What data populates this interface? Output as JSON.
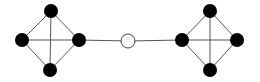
{
  "diagram": {
    "type": "graph",
    "width": 260,
    "height": 82,
    "colors": {
      "background": "#ffffff",
      "edge": "#555555",
      "filled_node": "#000000",
      "hollow_node_fill": "#ffffff",
      "hollow_node_stroke": "#444444"
    },
    "node_radius": 7,
    "nodes": [
      {
        "id": "L_top",
        "x": 51,
        "y": 11,
        "style": "filled"
      },
      {
        "id": "L_left",
        "x": 22,
        "y": 40,
        "style": "filled"
      },
      {
        "id": "L_right",
        "x": 79,
        "y": 40,
        "style": "filled"
      },
      {
        "id": "L_bottom",
        "x": 50,
        "y": 70,
        "style": "filled"
      },
      {
        "id": "center",
        "x": 128,
        "y": 41,
        "style": "hollow"
      },
      {
        "id": "R_left",
        "x": 182,
        "y": 40,
        "style": "filled"
      },
      {
        "id": "R_top",
        "x": 210,
        "y": 11,
        "style": "filled"
      },
      {
        "id": "R_right",
        "x": 237,
        "y": 40,
        "style": "filled"
      },
      {
        "id": "R_bottom",
        "x": 210,
        "y": 70,
        "style": "filled"
      }
    ],
    "edges": [
      [
        "L_top",
        "L_left"
      ],
      [
        "L_top",
        "L_right"
      ],
      [
        "L_left",
        "L_bottom"
      ],
      [
        "L_right",
        "L_bottom"
      ],
      [
        "L_left",
        "L_right"
      ],
      [
        "L_top",
        "L_bottom"
      ],
      [
        "L_right",
        "center"
      ],
      [
        "center",
        "R_left"
      ],
      [
        "R_top",
        "R_left"
      ],
      [
        "R_top",
        "R_right"
      ],
      [
        "R_left",
        "R_bottom"
      ],
      [
        "R_right",
        "R_bottom"
      ],
      [
        "R_left",
        "R_right"
      ],
      [
        "R_top",
        "R_bottom"
      ]
    ]
  }
}
